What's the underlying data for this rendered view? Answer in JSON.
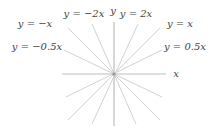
{
  "diagram": {
    "title": "",
    "origin": {
      "x": 114,
      "y": 74
    },
    "axes": {
      "x": {
        "label": "x",
        "from": [
          62,
          74
        ],
        "to": [
          166,
          74
        ],
        "label_pos": [
          176,
          77
        ]
      },
      "y": {
        "label": "y",
        "from": [
          114,
          22
        ],
        "to": [
          114,
          126
        ],
        "label_pos": [
          113,
          14
        ]
      }
    },
    "lines": [
      {
        "name": "y = -2x",
        "label": "y = −2x",
        "p1": [
          92,
          24
        ],
        "p2": [
          136,
          124
        ],
        "label_pos": [
          84,
          17
        ]
      },
      {
        "name": "y = -x",
        "label": "y = −x",
        "p1": [
          68,
          28
        ],
        "p2": [
          160,
          120
        ],
        "label_pos": [
          35,
          27
        ]
      },
      {
        "name": "y = -0.5x",
        "label": "y = −0.5x",
        "p1": [
          64,
          50
        ],
        "p2": [
          162,
          97
        ],
        "label_pos": [
          37,
          50
        ]
      },
      {
        "name": "y = 2x",
        "label": "y = 2x",
        "p1": [
          138,
          24
        ],
        "p2": [
          92,
          124
        ],
        "label_pos": [
          136,
          17
        ]
      },
      {
        "name": "y = x",
        "label": "y = x",
        "p1": [
          160,
          28
        ],
        "p2": [
          68,
          120
        ],
        "label_pos": [
          180,
          27
        ]
      },
      {
        "name": "y = 0.5x",
        "label": "y = 0.5x",
        "p1": [
          162,
          50
        ],
        "p2": [
          66,
          97
        ],
        "label_pos": [
          185,
          50
        ]
      }
    ],
    "colors": {
      "lines": "#d2d2d2",
      "axes": "#bdbdbd",
      "text": "#444444",
      "origin": "#9a9a9a"
    }
  }
}
